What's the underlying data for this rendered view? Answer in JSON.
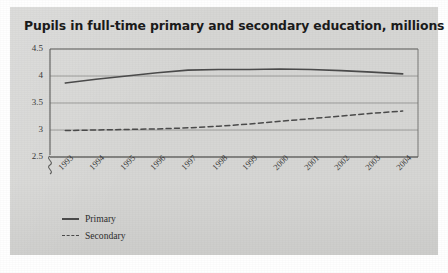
{
  "card": {
    "background_color": "#d6d6d4"
  },
  "chart_data": {
    "type": "line",
    "title": "Pupils in full-time primary and secondary education, millions",
    "xlabel": "",
    "ylabel": "",
    "ylim": [
      2.5,
      4.5
    ],
    "yticks": [
      "4.5",
      "4",
      "3.5",
      "3",
      "2.5"
    ],
    "ytick_values": [
      4.5,
      4,
      3.5,
      3,
      2.5
    ],
    "axis_break": true,
    "grid": true,
    "grid_orientation": "horizontal",
    "legend_position": "bottom-left",
    "categories": [
      "1993",
      "1994",
      "1995",
      "1996",
      "1997",
      "1998",
      "1999",
      "2000",
      "2001",
      "2002",
      "2003",
      "2004"
    ],
    "series": [
      {
        "name": "Primary",
        "style": "solid",
        "color": "#4b4b4b",
        "values": [
          3.87,
          3.94,
          4.0,
          4.06,
          4.11,
          4.12,
          4.12,
          4.13,
          4.12,
          4.1,
          4.07,
          4.04
        ]
      },
      {
        "name": "Secondary",
        "style": "dashed",
        "color": "#4b4b4b",
        "values": [
          2.99,
          3.0,
          3.01,
          3.02,
          3.04,
          3.07,
          3.11,
          3.16,
          3.21,
          3.26,
          3.31,
          3.35
        ]
      }
    ]
  },
  "legend": {
    "items": [
      {
        "label": "Primary",
        "style": "solid"
      },
      {
        "label": "Secondary",
        "style": "dashed"
      }
    ]
  }
}
